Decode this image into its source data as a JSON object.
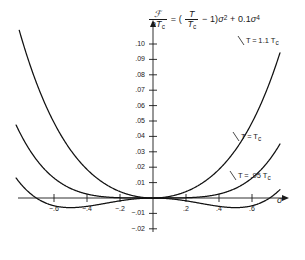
{
  "chart_data": {
    "type": "line",
    "equation": {
      "lhs_num": "ℱ",
      "lhs_den_a": "a",
      "lhs_den_T": "T",
      "lhs_den_sub": "c",
      "equals": "=",
      "paren_open": "(",
      "ratio_num": "T",
      "ratio_den": "T",
      "ratio_den_sub": "c",
      "minus_one": "− 1",
      "paren_close": ")",
      "sigma": "σ",
      "sq": "2",
      "plus": "+",
      "coeff": "0.1",
      "sigma2": "σ",
      "quartic": "4"
    },
    "xlabel": "σ",
    "ylabel": "",
    "xlim": [
      -0.75,
      0.75
    ],
    "ylim": [
      -0.025,
      0.105
    ],
    "grid": false,
    "legend_position": "inline-right",
    "xticks": [
      -0.6,
      -0.4,
      -0.2,
      0.2,
      0.4,
      0.6
    ],
    "xtick_labels": [
      "−.6",
      "−.4",
      "−.2",
      ".2",
      ".4",
      ".6"
    ],
    "yticks": [
      0.1,
      0.09,
      0.08,
      0.07,
      0.06,
      0.05,
      0.04,
      0.03,
      0.02,
      0.01,
      -0.01,
      -0.02
    ],
    "ytick_labels": [
      ".10",
      ".09",
      ".08",
      ".07",
      ".06",
      ".05",
      ".04",
      ".03",
      ".02",
      ".01",
      "−.01",
      "−.02"
    ],
    "series": [
      {
        "name": "T = 1.1 Tc",
        "label": "T = 1.1 T",
        "label_sub": "c",
        "t_ratio": 1.1,
        "quartic_coeff": 0.1,
        "color": "#111111",
        "x": [
          -0.72,
          -0.66,
          -0.6,
          -0.54,
          -0.48,
          -0.42,
          -0.36,
          -0.3,
          -0.24,
          -0.18,
          -0.12,
          -0.06,
          0.0,
          0.06,
          0.12,
          0.18,
          0.24,
          0.3,
          0.36,
          0.42,
          0.48,
          0.54,
          0.6,
          0.66,
          0.72
        ],
        "y": [
          0.0787,
          0.0625,
          0.049,
          0.0377,
          0.0283,
          0.0207,
          0.0146,
          0.0098,
          0.0061,
          0.0033,
          0.0014,
          0.0004,
          0.0,
          0.0004,
          0.0014,
          0.0033,
          0.0061,
          0.0098,
          0.0146,
          0.0207,
          0.0283,
          0.0377,
          0.049,
          0.0625,
          0.0787
        ]
      },
      {
        "name": "T = Tc",
        "label": "T = T",
        "label_sub": "c",
        "t_ratio": 1.0,
        "quartic_coeff": 0.1,
        "color": "#111111",
        "x": [
          -0.72,
          -0.6,
          -0.48,
          -0.36,
          -0.24,
          -0.12,
          0.0,
          0.12,
          0.24,
          0.36,
          0.48,
          0.6,
          0.72
        ],
        "y": [
          0.0269,
          0.013,
          0.0053,
          0.0017,
          0.0003,
          2e-05,
          0.0,
          2e-05,
          0.0003,
          0.0017,
          0.0053,
          0.013,
          0.0269
        ]
      },
      {
        "name": "T = .95 Tc",
        "label": "T = .95 T",
        "label_sub": "c",
        "t_ratio": 0.95,
        "quartic_coeff": 0.1,
        "color": "#111111",
        "x": [
          -0.72,
          -0.6,
          -0.48,
          -0.36,
          -0.24,
          -0.12,
          0.0,
          0.12,
          0.24,
          0.36,
          0.48,
          0.6,
          0.72
        ],
        "y": [
          0.001,
          -0.005,
          -0.0062,
          -0.0048,
          -0.0026,
          -0.0007,
          0.0,
          -0.0007,
          -0.0026,
          -0.0048,
          -0.0062,
          -0.005,
          0.001
        ]
      }
    ]
  }
}
